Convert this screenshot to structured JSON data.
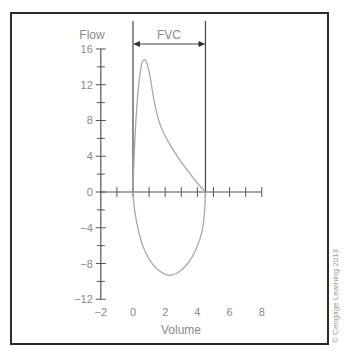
{
  "chart_data": {
    "type": "line",
    "title": "",
    "xlabel": "Volume",
    "ylabel": "Flow",
    "xlim": [
      -2,
      8
    ],
    "ylim": [
      -12,
      16
    ],
    "x_ticks": [
      -2,
      0,
      2,
      4,
      6,
      8
    ],
    "x_tick_labels": [
      "−2",
      "0",
      "2",
      "4",
      "6",
      "8"
    ],
    "y_ticks": [
      16,
      12,
      8,
      4,
      0,
      -4,
      -8,
      -12
    ],
    "y_tick_labels": [
      "16",
      "12",
      "8",
      "4",
      "0",
      "−4",
      "−8",
      "−12"
    ],
    "grid": false,
    "legend": null,
    "series": [
      {
        "name": "Expiratory limb",
        "points": [
          [
            0,
            0
          ],
          [
            0.05,
            3
          ],
          [
            0.15,
            7
          ],
          [
            0.3,
            11
          ],
          [
            0.5,
            14
          ],
          [
            0.7,
            14.8
          ],
          [
            0.9,
            14.2
          ],
          [
            1.1,
            12.5
          ],
          [
            1.3,
            10.3
          ],
          [
            1.6,
            8
          ],
          [
            1.9,
            6.6
          ],
          [
            2.4,
            5
          ],
          [
            2.9,
            3.6
          ],
          [
            3.4,
            2.4
          ],
          [
            3.9,
            1.2
          ],
          [
            4.5,
            0
          ]
        ]
      },
      {
        "name": "Inspiratory limb",
        "points": [
          [
            0,
            0
          ],
          [
            0.1,
            -2
          ],
          [
            0.3,
            -4
          ],
          [
            0.6,
            -6
          ],
          [
            1.0,
            -7.5
          ],
          [
            1.5,
            -8.6
          ],
          [
            2.2,
            -9.3
          ],
          [
            2.8,
            -9
          ],
          [
            3.4,
            -8
          ],
          [
            3.9,
            -6.5
          ],
          [
            4.3,
            -4.3
          ],
          [
            4.45,
            -2
          ],
          [
            4.5,
            0
          ]
        ]
      }
    ],
    "annotations": [
      {
        "type": "bracket",
        "label": "FVC",
        "x_start": 0,
        "x_end": 4.5,
        "description": "Double-headed arrow spanning forced vital capacity between vertical lines at volume 0 and 4.5"
      }
    ]
  },
  "labels": {
    "y_axis_title": "Flow",
    "x_axis_title": "Volume",
    "fvc_label": "FVC",
    "copyright": "© Cengage Learning 2013"
  },
  "colors": {
    "curve": "#a8a8a8",
    "axis": "#555555",
    "text": "#8a8a8a",
    "frame": "#2b2b2b"
  }
}
